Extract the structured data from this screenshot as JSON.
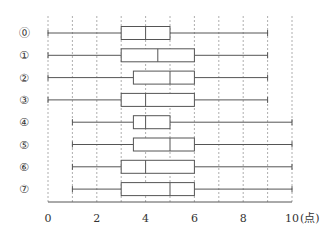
{
  "chart_data": {
    "type": "boxplot",
    "title": "",
    "xlabel": "(点)",
    "ylabel": "",
    "xlim": [
      0,
      10
    ],
    "x_ticks": [
      0,
      2,
      4,
      6,
      8,
      10
    ],
    "x_tick_labels": [
      "0",
      "2",
      "4",
      "6",
      "8",
      "10"
    ],
    "x_unit_label": "(点)",
    "grid": {
      "vertical_dotted": true,
      "every": 1
    },
    "categories": [
      "⓪",
      "①",
      "②",
      "③",
      "④",
      "⑤",
      "⑥",
      "⑦"
    ],
    "series": [
      {
        "name": "⓪",
        "min": 0,
        "q1": 3,
        "median": 4,
        "q3": 5,
        "max": 9
      },
      {
        "name": "①",
        "min": 0,
        "q1": 3,
        "median": 4.5,
        "q3": 6,
        "max": 9
      },
      {
        "name": "②",
        "min": 0,
        "q1": 3.5,
        "median": 5,
        "q3": 6,
        "max": 9
      },
      {
        "name": "③",
        "min": 0,
        "q1": 3,
        "median": 4,
        "q3": 6,
        "max": 9
      },
      {
        "name": "④",
        "min": 1,
        "q1": 3.5,
        "median": 4,
        "q3": 5,
        "max": 10
      },
      {
        "name": "⑤",
        "min": 1,
        "q1": 3.5,
        "median": 5,
        "q3": 6,
        "max": 10
      },
      {
        "name": "⑥",
        "min": 1,
        "q1": 3,
        "median": 4,
        "q3": 6,
        "max": 10
      },
      {
        "name": "⑦",
        "min": 1,
        "q1": 3,
        "median": 5,
        "q3": 6,
        "max": 10
      }
    ]
  },
  "colors": {
    "line": "#555555",
    "grid": "#999999",
    "text": "#333333"
  }
}
